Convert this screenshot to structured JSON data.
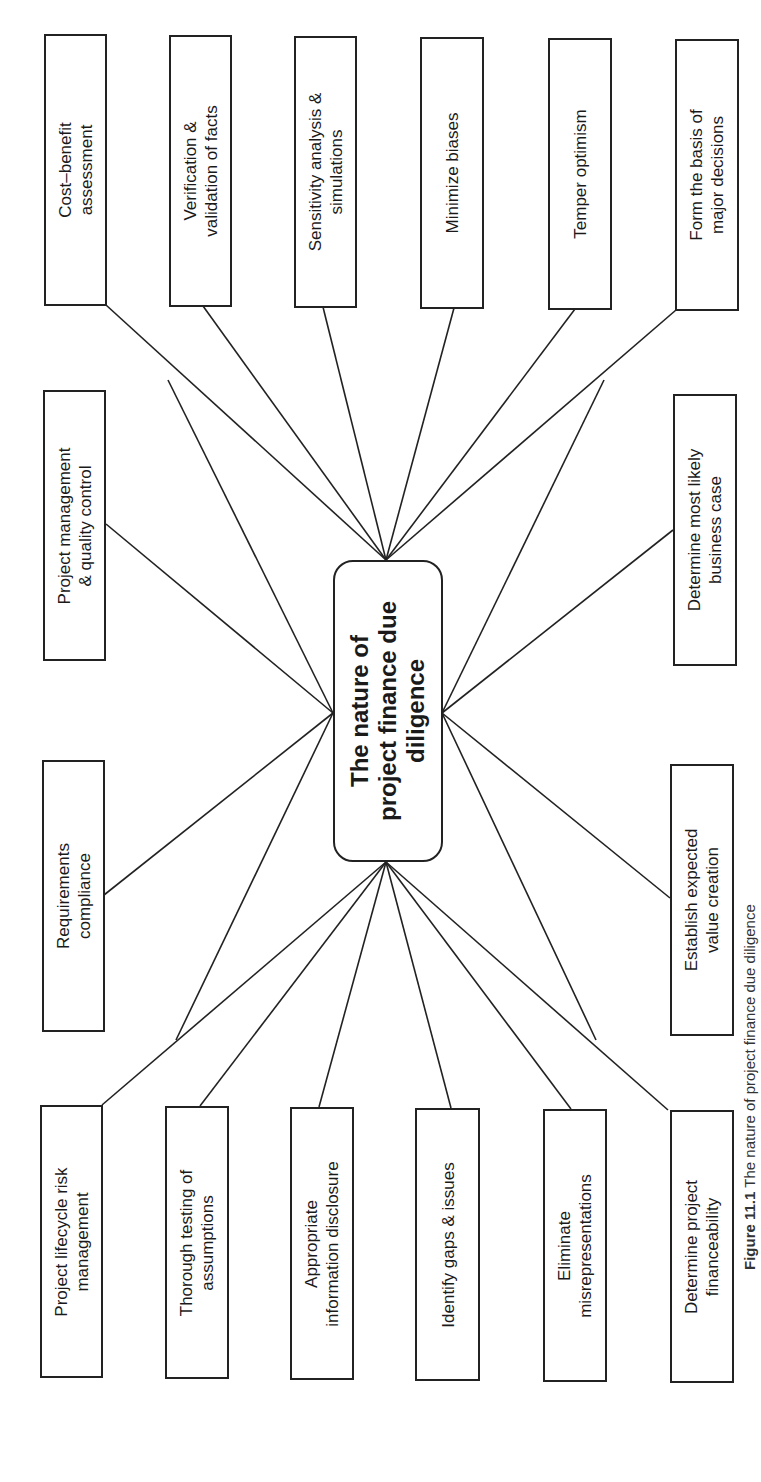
{
  "figure": {
    "caption_label": "Figure 11.1",
    "caption_text": " The nature of project finance due diligence"
  },
  "center": {
    "lines": [
      "The nature of",
      "project finance due",
      "diligence"
    ]
  },
  "top_row": [
    {
      "id": "cost-benefit",
      "lines": [
        "Cost–benefit",
        "assessment"
      ]
    },
    {
      "id": "verification",
      "lines": [
        "Verification &",
        "validation of facts"
      ]
    },
    {
      "id": "sensitivity",
      "lines": [
        "Sensitivity analysis &",
        "simulations"
      ]
    },
    {
      "id": "minimize-biases",
      "lines": [
        "Minimize biases"
      ]
    },
    {
      "id": "temper-optimism",
      "lines": [
        "Temper optimism"
      ]
    },
    {
      "id": "form-basis",
      "lines": [
        "Form the basis of",
        "major decisions"
      ]
    }
  ],
  "middle_left": [
    {
      "id": "project-management",
      "lines": [
        "Project management",
        "& quality control"
      ]
    },
    {
      "id": "requirements",
      "lines": [
        "Requirements",
        "compliance"
      ]
    }
  ],
  "middle_right": [
    {
      "id": "most-likely-case",
      "lines": [
        "Determine most likely",
        "business case"
      ]
    },
    {
      "id": "expected-value",
      "lines": [
        "Establish expected",
        "value creation"
      ]
    }
  ],
  "bottom_row": [
    {
      "id": "lifecycle-risk",
      "lines": [
        "Project lifecycle risk",
        "management"
      ]
    },
    {
      "id": "testing-assumptions",
      "lines": [
        "Thorough testing of",
        "assumptions"
      ]
    },
    {
      "id": "info-disclosure",
      "lines": [
        "Appropriate",
        "information disclosure"
      ]
    },
    {
      "id": "gaps-issues",
      "lines": [
        "Identify gaps & issues"
      ]
    },
    {
      "id": "misrepresentations",
      "lines": [
        "Eliminate",
        "misrepresentations"
      ]
    },
    {
      "id": "financeability",
      "lines": [
        "Determine project",
        "financeability"
      ]
    }
  ],
  "colors": {
    "stroke": "#222222",
    "text": "#1a1a1a",
    "background": "#ffffff"
  }
}
